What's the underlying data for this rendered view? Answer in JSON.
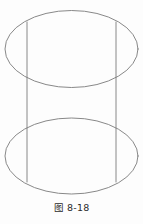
{
  "figure": {
    "caption": "图 8-18",
    "caption_label_prefix": "图",
    "caption_number": "8-18",
    "background_color": "#fdfdfd",
    "stroke_color": "#7b7b7b",
    "stroke_width": 0.9,
    "geometry": {
      "top_ellipse": {
        "cx": 71.5,
        "cy": 49,
        "rx": 66.5,
        "ry": 38.5
      },
      "bottom_ellipse": {
        "cx": 71.5,
        "cy": 156,
        "rx": 66.5,
        "ry": 38
      },
      "left_side_line": {
        "x1": 27,
        "y1": 22,
        "x2": 27,
        "y2": 182
      },
      "right_side_line": {
        "x1": 116,
        "y1": 22,
        "x2": 116,
        "y2": 182
      }
    }
  }
}
